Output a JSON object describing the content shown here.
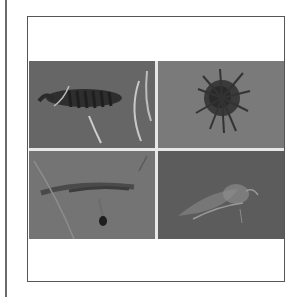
{
  "figure": {
    "layout": "2x2 grid of grayscale photographs inside a bordered frame",
    "panels": [
      {
        "position": "top-left",
        "subject": "segmented larva-like organism"
      },
      {
        "position": "top-right",
        "subject": "spiky rounded organism"
      },
      {
        "position": "bottom-left",
        "subject": "elongated shrimp-like organism"
      },
      {
        "position": "bottom-right",
        "subject": "translucent winged insect"
      }
    ],
    "colors": {
      "frame_border": "#555555",
      "margin_line": "#6a6a6a",
      "photo_bg": "#6e6e6e",
      "divider": "#e8e8e8"
    }
  }
}
